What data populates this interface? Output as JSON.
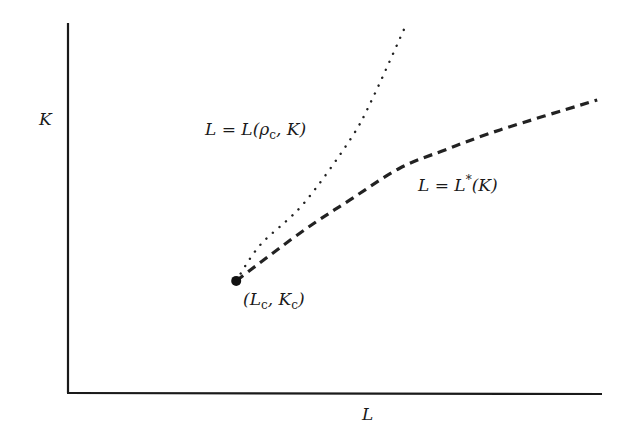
{
  "chart_data": {
    "type": "line",
    "title": "",
    "xlabel": "L",
    "ylabel": "K",
    "xlim": [
      0,
      1
    ],
    "ylim": [
      0,
      1
    ],
    "grid": false,
    "ticks": "none",
    "critical_point": {
      "x": 0.315,
      "y": 0.303,
      "label": "(L_c, K_c)"
    },
    "series": [
      {
        "name": "L = L(ρ_c, K)",
        "style": "dotted",
        "color": "#222222",
        "points": [
          [
            0.315,
            0.303
          ],
          [
            0.36,
            0.4
          ],
          [
            0.44,
            0.51
          ],
          [
            0.528,
            0.684
          ],
          [
            0.569,
            0.792
          ],
          [
            0.633,
            0.995
          ]
        ]
      },
      {
        "name": "L = L*(K)",
        "style": "dashed",
        "color": "#222222",
        "points": [
          [
            0.315,
            0.303
          ],
          [
            0.434,
            0.432
          ],
          [
            0.528,
            0.522
          ],
          [
            0.622,
            0.608
          ],
          [
            0.706,
            0.657
          ],
          [
            0.809,
            0.711
          ],
          [
            0.991,
            0.792
          ]
        ]
      }
    ],
    "annotations": {
      "dotted_label": {
        "lhs": "L",
        "eq": " = ",
        "fn": "L(",
        "rho": "ρ",
        "sub": "c",
        "rest": ", K)"
      },
      "dashed_label": {
        "lhs": "L",
        "eq": " = ",
        "fn": "L",
        "sup": "*",
        "rest": "(K)"
      },
      "point_label": {
        "open": "(L",
        "sub1": "c",
        "mid": ", K",
        "sub2": "c",
        "close": ")"
      }
    }
  }
}
